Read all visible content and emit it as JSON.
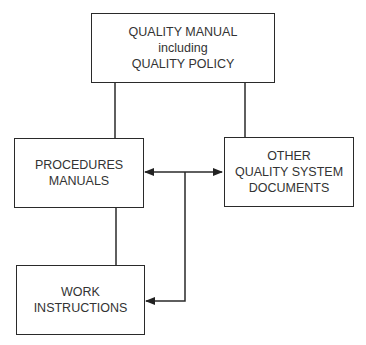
{
  "diagram": {
    "nodes": [
      {
        "id": "quality-manual",
        "lines": [
          "QUALITY MANUAL",
          "including",
          "QUALITY POLICY"
        ]
      },
      {
        "id": "procedures-manuals",
        "lines": [
          "PROCEDURES",
          "MANUALS"
        ]
      },
      {
        "id": "other-documents",
        "lines": [
          "OTHER",
          "QUALITY SYSTEM",
          "DOCUMENTS"
        ]
      },
      {
        "id": "work-instructions",
        "lines": [
          "WORK",
          "INSTRUCTIONS"
        ]
      }
    ],
    "edges": [
      {
        "from": "quality-manual",
        "to": "procedures-manuals",
        "type": "line"
      },
      {
        "from": "quality-manual",
        "to": "other-documents",
        "type": "line"
      },
      {
        "from": "procedures-manuals",
        "to": "work-instructions",
        "type": "line"
      },
      {
        "from": "procedures-manuals",
        "to": "other-documents",
        "type": "bidirectional-arrow"
      },
      {
        "from": "connector",
        "to": "work-instructions",
        "type": "arrow"
      }
    ]
  }
}
